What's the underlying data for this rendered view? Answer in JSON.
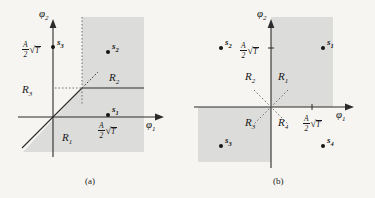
{
  "figure": {
    "background_color": "#f6f5f2",
    "shade_color": "#dcdcda",
    "line_color": "#2b2b2b",
    "panels": [
      {
        "caption": "(a)",
        "axes": {
          "x_label": "ϕ",
          "x_sub": "1",
          "y_label": "ϕ",
          "y_sub": "2"
        },
        "regions": [
          {
            "name": "R",
            "sub": "1"
          },
          {
            "name": "R",
            "sub": "2"
          },
          {
            "name": "R",
            "sub": "3"
          }
        ],
        "signal_points": [
          {
            "name": "s",
            "sub": "1"
          },
          {
            "name": "s",
            "sub": "2"
          },
          {
            "name": "s",
            "sub": "3"
          }
        ],
        "annotations": [
          {
            "numerator": "A",
            "denominator": "2",
            "radical": "T"
          },
          {
            "numerator": "A",
            "denominator": "2",
            "radical": "T"
          }
        ]
      },
      {
        "caption": "(b)",
        "axes": {
          "x_label": "ϕ",
          "x_sub": "1",
          "y_label": "ϕ",
          "y_sub": "2"
        },
        "regions": [
          {
            "name": "R",
            "sub": "1"
          },
          {
            "name": "R",
            "sub": "2"
          },
          {
            "name": "R",
            "sub": "3"
          },
          {
            "name": "R",
            "sub": "4"
          }
        ],
        "signal_points": [
          {
            "name": "s",
            "sub": "1"
          },
          {
            "name": "s",
            "sub": "2"
          },
          {
            "name": "s",
            "sub": "3"
          },
          {
            "name": "s",
            "sub": "4"
          }
        ],
        "annotations": [
          {
            "numerator": "A",
            "denominator": "2",
            "radical": "T"
          },
          {
            "numerator": "A",
            "denominator": "2",
            "radical": "T"
          }
        ]
      }
    ]
  }
}
